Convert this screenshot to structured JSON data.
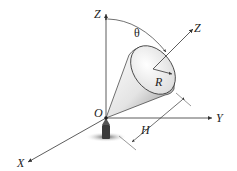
{
  "diagram": {
    "type": "3d-geometry",
    "labels": {
      "z_axis": "Z",
      "y_axis": "Y",
      "x_axis": "X",
      "origin": "O",
      "tilted_axis": "Z",
      "angle": "θ",
      "radius": "R",
      "height": "H"
    },
    "colors": {
      "line": "#333333",
      "cone_light": "#f4f4f4",
      "cone_dark": "#9a9a9a",
      "shadow": "#6a6a6a"
    }
  }
}
